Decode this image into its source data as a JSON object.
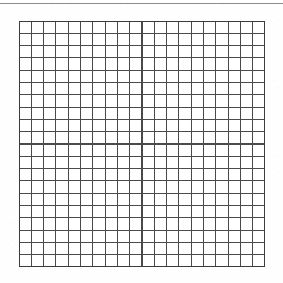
{
  "document": {
    "kind": "blank-grid-worksheet",
    "background_color": "#fefefe",
    "width": 283,
    "height": 283,
    "title_text": "",
    "body_text": "",
    "caption_text": ""
  },
  "top_rule": {
    "present": true,
    "color": "#8d8d8d",
    "y": 3,
    "x_start": 0,
    "x_end": 283,
    "thickness": 1
  },
  "grid": {
    "label": "",
    "columns": 20,
    "rows": 20,
    "cell_width": 12.3,
    "cell_height": 12.3,
    "x": 19,
    "y": 21,
    "width": 246,
    "height": 246,
    "line_color": "#4a4a4a",
    "line_width": 1.1,
    "border_color": "#3c3c3c",
    "border_width": 1.4,
    "fill_color": "#ffffff",
    "contents": []
  },
  "annotations": []
}
